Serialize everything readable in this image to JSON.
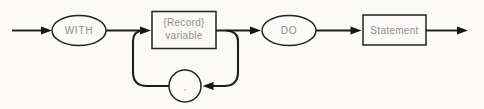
{
  "diagram": {
    "kind": "railroad-syntax-diagram",
    "nodes": {
      "with_terminal": "WITH",
      "record_variable_line1": "{Record}",
      "record_variable_line2": "variable",
      "loop_separator": ",",
      "do_terminal": "DO",
      "statement_nonterminal": "Statement"
    },
    "colors": {
      "line": "#1d1d1d",
      "node_text": "#8e8e8e",
      "background": "#fbfaf7"
    }
  }
}
